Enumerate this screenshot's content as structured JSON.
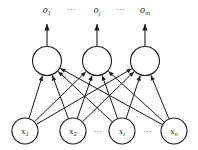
{
  "diagram": {
    "type": "neural-network",
    "canvas": {
      "width": 198,
      "height": 150,
      "background": "#ffffff"
    },
    "stroke_color": "#1a1a1a",
    "node_fill": "#ffffff",
    "output_labels": [
      {
        "id": "o1",
        "base": "o",
        "sub": "1",
        "x": 47,
        "y": 13
      },
      {
        "id": "o_j",
        "base": "o",
        "sub": "j",
        "x": 97,
        "y": 13
      },
      {
        "id": "o_m",
        "base": "o",
        "sub": "m",
        "x": 145,
        "y": 13
      }
    ],
    "top_ellipses": [
      {
        "id": "top-ellipsis-1",
        "text": "···",
        "x": 72,
        "y": 12
      },
      {
        "id": "top-ellipsis-2",
        "text": "···",
        "x": 121,
        "y": 12
      }
    ],
    "output_nodes": [
      {
        "id": "out-1",
        "cx": 47,
        "cy": 61,
        "r": 14.5
      },
      {
        "id": "out-j",
        "cx": 97,
        "cy": 61,
        "r": 14.5
      },
      {
        "id": "out-m",
        "cx": 145,
        "cy": 61,
        "r": 14.5
      }
    ],
    "input_nodes": [
      {
        "id": "in-1",
        "base": "x",
        "sub": "1",
        "cx": 25,
        "cy": 131,
        "r": 13
      },
      {
        "id": "in-2",
        "base": "x",
        "sub": "2",
        "cx": 73,
        "cy": 131,
        "r": 13
      },
      {
        "id": "in-i",
        "base": "x",
        "sub": "i",
        "cx": 122,
        "cy": 131,
        "r": 13
      },
      {
        "id": "in-n",
        "base": "x",
        "sub": "n",
        "cx": 174,
        "cy": 131,
        "r": 13
      }
    ],
    "input_ellipses": [
      {
        "id": "input-ellipsis-1",
        "text": "···",
        "x": 98,
        "y": 134
      },
      {
        "id": "input-ellipsis-2",
        "text": "···",
        "x": 148,
        "y": 134
      }
    ],
    "output_stems": [
      {
        "id": "stem-1",
        "x": 47,
        "y_top": 24,
        "y_bottom": 46
      },
      {
        "id": "stem-j",
        "x": 97,
        "y_top": 24,
        "y_bottom": 46
      },
      {
        "id": "stem-m",
        "x": 145,
        "y_top": 24,
        "y_bottom": 46
      }
    ],
    "connections_note": "fully connected: each of 4 input nodes links to each of 3 output nodes (12 directed edges, arrowheads at output end)",
    "edge_count": 12
  }
}
